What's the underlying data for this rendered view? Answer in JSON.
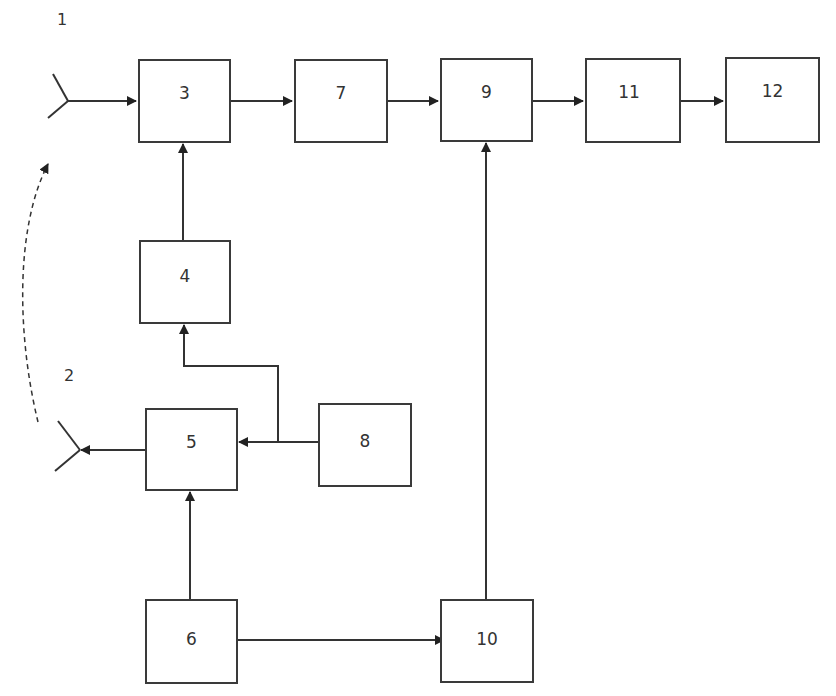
{
  "diagram": {
    "type": "block-diagram",
    "colors": {
      "line": "#333333",
      "background": "#ffffff"
    },
    "antenna_labels": [
      {
        "id": "1",
        "text": "1"
      },
      {
        "id": "2",
        "text": "2"
      }
    ],
    "blocks": [
      {
        "id": "3",
        "label": "3"
      },
      {
        "id": "4",
        "label": "4"
      },
      {
        "id": "5",
        "label": "5"
      },
      {
        "id": "6",
        "label": "6"
      },
      {
        "id": "7",
        "label": "7"
      },
      {
        "id": "8",
        "label": "8"
      },
      {
        "id": "9",
        "label": "9"
      },
      {
        "id": "10",
        "label": "10"
      },
      {
        "id": "11",
        "label": "11"
      },
      {
        "id": "12",
        "label": "12"
      }
    ],
    "connections": [
      {
        "from": "antenna-1",
        "to": "3"
      },
      {
        "from": "3",
        "to": "7"
      },
      {
        "from": "7",
        "to": "9"
      },
      {
        "from": "9",
        "to": "11"
      },
      {
        "from": "11",
        "to": "12"
      },
      {
        "from": "4",
        "to": "3"
      },
      {
        "from": "8",
        "to": "4"
      },
      {
        "from": "8",
        "to": "5"
      },
      {
        "from": "5",
        "to": "antenna-2"
      },
      {
        "from": "6",
        "to": "5"
      },
      {
        "from": "6",
        "to": "10"
      },
      {
        "from": "10",
        "to": "9"
      },
      {
        "from": "antenna-2",
        "to": "antenna-1",
        "style": "dashed"
      }
    ]
  }
}
